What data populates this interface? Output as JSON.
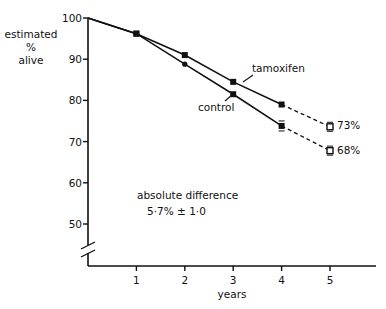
{
  "chart_data": {
    "type": "line",
    "title": "",
    "xlabel": "years",
    "ylabel": "estimated % alive",
    "ylabel_lines": [
      "estimated",
      "%",
      "alive"
    ],
    "x_ticks": [
      "1",
      "2",
      "3",
      "4",
      "5"
    ],
    "y_ticks": [
      "100",
      "90",
      "80",
      "70",
      "60",
      "50"
    ],
    "ylim": [
      45,
      100
    ],
    "xlim": [
      0,
      6
    ],
    "axis_break": true,
    "grid": false,
    "series": [
      {
        "name": "tamoxifen",
        "x": [
          0,
          1,
          2,
          3,
          4,
          5
        ],
        "values": [
          100,
          96.2,
          91.0,
          84.5,
          79.0,
          73.6
        ],
        "dashed_from_x": 4,
        "end_label": "73%"
      },
      {
        "name": "control",
        "x": [
          0,
          1,
          2,
          3,
          4,
          5
        ],
        "values": [
          100,
          96.2,
          88.8,
          81.5,
          73.8,
          67.8
        ],
        "dashed_from_x": 4,
        "end_label": "68%"
      }
    ],
    "annotations": [
      {
        "text": "absolute difference",
        "x": 2.5,
        "y": 62
      },
      {
        "text": "5·7% ± 1·0",
        "x": 2.5,
        "y": 57
      }
    ]
  },
  "labels": {
    "ylabel_1": "estimated",
    "ylabel_2": "%",
    "ylabel_3": "alive",
    "xlabel": "years",
    "tamoxifen": "tamoxifen",
    "control": "control",
    "tam_end": "73%",
    "ctl_end": "68%",
    "annot_1": "absolute difference",
    "annot_2": "5·7% ± 1·0"
  }
}
